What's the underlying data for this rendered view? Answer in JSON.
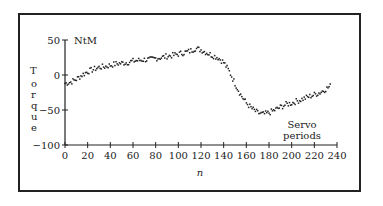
{
  "chart_data": {
    "type": "scatter",
    "title": "",
    "xlabel": "n",
    "ylabel": "Torque",
    "y_unit": "NtM",
    "annotation": "Servo periods",
    "xlim": [
      0,
      240
    ],
    "ylim": [
      -100,
      50
    ],
    "x_ticks": [
      "0",
      "20",
      "40",
      "60",
      "80",
      "100",
      "120",
      "140",
      "160",
      "180",
      "200",
      "220",
      "240"
    ],
    "y_ticks": [
      "50",
      "0",
      "−50",
      "−100"
    ],
    "grid": false,
    "legend": null,
    "series": [
      {
        "name": "Torque",
        "x": [
          0,
          5,
          10,
          15,
          20,
          25,
          30,
          35,
          40,
          45,
          50,
          55,
          60,
          65,
          70,
          75,
          80,
          85,
          90,
          95,
          100,
          105,
          110,
          115,
          120,
          125,
          130,
          135,
          140,
          145,
          150,
          155,
          160,
          165,
          170,
          175,
          180,
          185,
          190,
          195,
          200,
          205,
          210,
          215,
          220,
          225,
          230,
          235
        ],
        "values": [
          -12,
          -10,
          -6,
          0,
          5,
          8,
          11,
          12,
          14,
          16,
          17,
          18,
          20,
          21,
          22,
          22,
          24,
          25,
          27,
          28,
          30,
          32,
          34,
          38,
          36,
          32,
          28,
          25,
          18,
          5,
          -12,
          -28,
          -40,
          -48,
          -54,
          -56,
          -54,
          -50,
          -46,
          -42,
          -40,
          -37,
          -34,
          -31,
          -28,
          -25,
          -20,
          -15
        ]
      }
    ]
  },
  "labels": {
    "y_unit": "NtM",
    "ylabel_letters": [
      "T",
      "o",
      "r",
      "q",
      "u",
      "e"
    ],
    "annotation_line1": "Servo",
    "annotation_line2": "periods",
    "xlabel": "n"
  }
}
